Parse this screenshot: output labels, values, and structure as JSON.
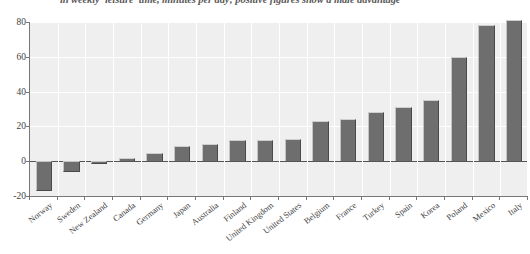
{
  "chart_data": {
    "type": "bar",
    "title": "in weekly 'leisure' time, minutes per day; positive figures show a male advantage",
    "xlabel": "",
    "ylabel": "",
    "ylim": [
      -20,
      80
    ],
    "yticks": [
      80,
      60,
      40,
      20,
      0,
      -20
    ],
    "grid": true,
    "legend": "none",
    "orientation": "vertical",
    "bar_color": "#6e6e6e",
    "plot_background": "#efefef",
    "gridline_color": "#ffffff",
    "axis_color": "#777777",
    "categories": [
      "Norway",
      "Sweden",
      "New Zealand",
      "Canada",
      "Germany",
      "Japan",
      "Australia",
      "Finland",
      "United Kingdom",
      "United States",
      "Belgium",
      "France",
      "Turkey",
      "Spain",
      "Korea",
      "Poland",
      "Mexico",
      "Italy"
    ],
    "values": [
      -17,
      -6,
      -1.5,
      2,
      5,
      9,
      10,
      12,
      12,
      13,
      23,
      24,
      28,
      31,
      35,
      60,
      78,
      81
    ]
  }
}
